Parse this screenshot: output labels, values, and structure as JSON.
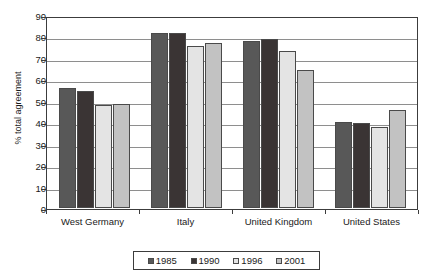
{
  "chart_data": {
    "type": "bar",
    "title": "",
    "xlabel": "",
    "ylabel": "% total agreement",
    "ylim": [
      0,
      90
    ],
    "yticks": [
      0,
      10,
      20,
      30,
      40,
      50,
      60,
      70,
      80,
      90
    ],
    "grid": true,
    "legend_position": "bottom",
    "categories": [
      "West Germany",
      "Italy",
      "United Kingdom",
      "United States"
    ],
    "series": [
      {
        "name": "1985",
        "color": "#585858",
        "values": [
          56,
          81.5,
          78,
          40
        ]
      },
      {
        "name": "1990",
        "color": "#3a3434",
        "values": [
          54.5,
          81.5,
          79,
          39.5
        ]
      },
      {
        "name": "1996",
        "color": "#e4e4e4",
        "values": [
          48,
          75.5,
          73,
          38
        ]
      },
      {
        "name": "2001",
        "color": "#c2c2c2",
        "values": [
          48.5,
          77,
          64.5,
          45.5
        ]
      }
    ]
  },
  "axes": {
    "ylabel": "% total agreement",
    "ytick_labels": [
      "90",
      "80",
      "70",
      "60",
      "50",
      "40",
      "30",
      "20",
      "10",
      "0"
    ],
    "xtick_labels": [
      "West Germany",
      "Italy",
      "United Kingdom",
      "United States"
    ]
  },
  "legend": {
    "items": [
      {
        "label": "1985",
        "color": "#585858"
      },
      {
        "label": "1990",
        "color": "#3a3434"
      },
      {
        "label": "1996",
        "color": "#e4e4e4"
      },
      {
        "label": "2001",
        "color": "#c2c2c2"
      }
    ]
  }
}
